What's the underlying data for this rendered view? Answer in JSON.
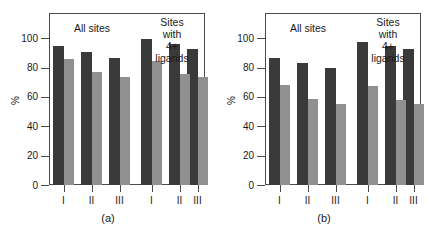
{
  "figure": {
    "panels": [
      {
        "caption": "(a)",
        "yaxis_title": "%",
        "yticks": [
          0,
          20,
          40,
          60,
          80,
          100
        ],
        "xlabels": [
          "I",
          "II",
          "III",
          "I",
          "II",
          "III"
        ],
        "group_labels": [
          "All sites",
          "Sites with\n4+ ligands"
        ],
        "series": [
          {
            "name": "dark",
            "color": "#3a3a3a",
            "values": [
              95,
              91,
              86.5,
              99.5,
              96,
              92.5
            ]
          },
          {
            "name": "light",
            "color": "#909090",
            "values": [
              86,
              77,
              73.5,
              84.5,
              76,
              73.5
            ]
          }
        ]
      },
      {
        "caption": "(b)",
        "yaxis_title": "%",
        "yticks": [
          0,
          20,
          40,
          60,
          80,
          100
        ],
        "xlabels": [
          "I",
          "II",
          "III",
          "I",
          "II",
          "III"
        ],
        "group_labels": [
          "All sites",
          "Sites with\n4+ ligands"
        ],
        "series": [
          {
            "name": "dark",
            "color": "#3a3a3a",
            "values": [
              86.5,
              83,
              79.5,
              97.5,
              94.5,
              92.5
            ]
          },
          {
            "name": "light",
            "color": "#909090",
            "values": [
              68,
              58.5,
              55,
              67.5,
              58,
              55
            ]
          }
        ]
      }
    ]
  },
  "chart_data": [
    {
      "type": "bar",
      "title": "(a)",
      "xlabel": "",
      "ylabel": "%",
      "ylim": [
        0,
        100
      ],
      "yticks": [
        0,
        20,
        40,
        60,
        80,
        100
      ],
      "grid": false,
      "legend": "none",
      "categories": [
        "I",
        "II",
        "III",
        "I",
        "II",
        "III"
      ],
      "category_groups": [
        {
          "label": "All sites",
          "categories": [
            "I",
            "II",
            "III"
          ]
        },
        {
          "label": "Sites with 4+ ligands",
          "categories": [
            "I",
            "II",
            "III"
          ]
        }
      ],
      "series": [
        {
          "name": "dark",
          "color": "#3a3a3a",
          "values": [
            95,
            91,
            86.5,
            99.5,
            96,
            92.5
          ]
        },
        {
          "name": "light",
          "color": "#909090",
          "values": [
            86,
            77,
            73.5,
            84.5,
            76,
            73.5
          ]
        }
      ],
      "annotations": [
        "All sites",
        "Sites with 4+ ligands"
      ]
    },
    {
      "type": "bar",
      "title": "(b)",
      "xlabel": "",
      "ylabel": "%",
      "ylim": [
        0,
        100
      ],
      "yticks": [
        0,
        20,
        40,
        60,
        80,
        100
      ],
      "grid": false,
      "legend": "none",
      "categories": [
        "I",
        "II",
        "III",
        "I",
        "II",
        "III"
      ],
      "category_groups": [
        {
          "label": "All sites",
          "categories": [
            "I",
            "II",
            "III"
          ]
        },
        {
          "label": "Sites with 4+ ligands",
          "categories": [
            "I",
            "II",
            "III"
          ]
        }
      ],
      "series": [
        {
          "name": "dark",
          "color": "#3a3a3a",
          "values": [
            86.5,
            83,
            79.5,
            97.5,
            94.5,
            92.5
          ]
        },
        {
          "name": "light",
          "color": "#909090",
          "values": [
            68,
            58.5,
            55,
            67.5,
            58,
            55
          ]
        }
      ],
      "annotations": [
        "All sites",
        "Sites with 4+ ligands"
      ]
    }
  ]
}
